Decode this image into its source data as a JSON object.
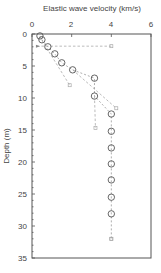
{
  "chart_data": {
    "type": "scatter",
    "title": "Elastic wave velocity (km/s)",
    "xlabel": "Elastic wave velocity (km/s)",
    "ylabel": "Depth (m)",
    "xlim": [
      0,
      6
    ],
    "ylim": [
      0,
      35
    ],
    "y_inverted": true,
    "x_axis_position": "top",
    "x_ticks": [
      0,
      2,
      4,
      6
    ],
    "y_ticks": [
      0,
      5,
      10,
      15,
      20,
      25,
      30,
      35
    ],
    "grid": false,
    "legend": null,
    "series": [
      {
        "name": "profile-1 (circles)",
        "marker": "circle",
        "line": "dashed",
        "color": "#555555",
        "points": [
          {
            "v": 0.4,
            "d": 0.3
          },
          {
            "v": 0.5,
            "d": 0.9
          },
          {
            "v": 0.8,
            "d": 2.0
          },
          {
            "v": 1.15,
            "d": 3.1
          },
          {
            "v": 1.5,
            "d": 4.5
          },
          {
            "v": 2.05,
            "d": 5.6
          },
          {
            "v": 3.15,
            "d": 6.9
          },
          {
            "v": 3.15,
            "d": 9.7
          },
          {
            "v": 4.0,
            "d": 12.5
          },
          {
            "v": 4.0,
            "d": 15.2
          },
          {
            "v": 4.0,
            "d": 17.8
          },
          {
            "v": 4.0,
            "d": 20.3
          },
          {
            "v": 4.0,
            "d": 22.8
          },
          {
            "v": 4.0,
            "d": 25.5
          },
          {
            "v": 4.0,
            "d": 28.1
          },
          {
            "v": 4.0,
            "d": 32.0
          }
        ]
      },
      {
        "name": "profile-2 (small markers)",
        "marker": "small-square",
        "line": "dashed",
        "color": "#aaaaaa",
        "segments": [
          [
            {
              "v": 0.25,
              "d": 1.9
            },
            {
              "v": 4.0,
              "d": 1.9
            }
          ],
          [
            {
              "v": 0.5,
              "d": 1.0
            },
            {
              "v": 1.9,
              "d": 8.0
            }
          ],
          [
            {
              "v": 2.05,
              "d": 5.6
            },
            {
              "v": 4.25,
              "d": 11.6
            }
          ],
          [
            {
              "v": 3.15,
              "d": 9.7
            },
            {
              "v": 3.2,
              "d": 14.7
            }
          ]
        ],
        "markers": [
          {
            "v": 4.0,
            "d": 1.9
          },
          {
            "v": 1.9,
            "d": 8.0
          },
          {
            "v": 4.25,
            "d": 11.6
          },
          {
            "v": 3.2,
            "d": 14.7
          },
          {
            "v": 4.0,
            "d": 32.0
          }
        ]
      }
    ]
  },
  "labels": {
    "title": "Elastic wave velocity (km/s)",
    "ylabel": "Depth (m)",
    "x_tick_0": "0",
    "x_tick_2": "2",
    "x_tick_4": "4",
    "x_tick_6": "6",
    "y_tick_0": "0",
    "y_tick_5": "5",
    "y_tick_10": "10",
    "y_tick_15": "15",
    "y_tick_20": "20",
    "y_tick_25": "25",
    "y_tick_30": "30",
    "y_tick_35": "35"
  }
}
